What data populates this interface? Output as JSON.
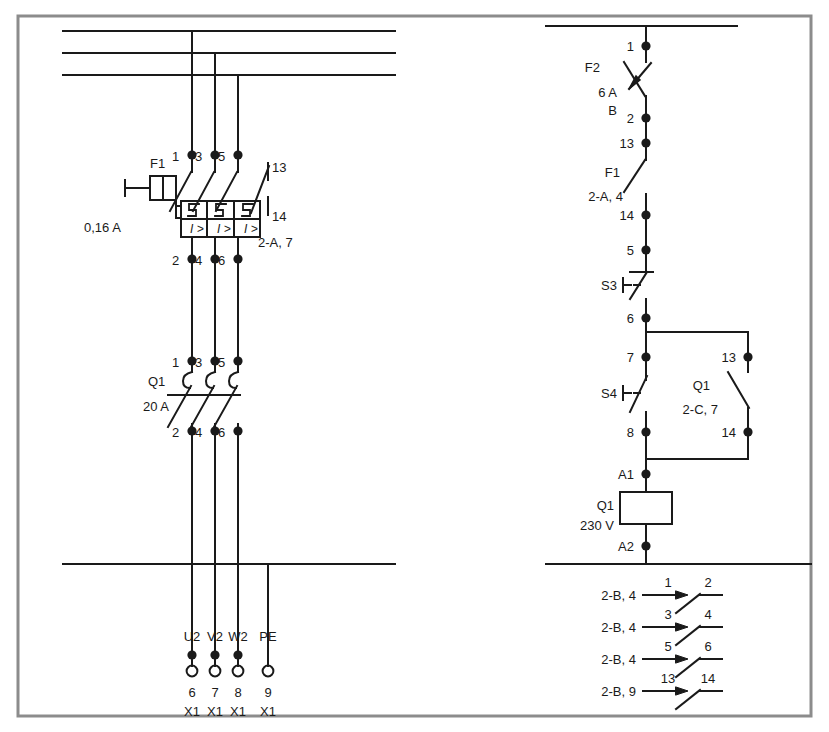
{
  "diagram": {
    "type": "electrical-schematic",
    "sheet": {
      "width": 829,
      "height": 732,
      "background": "#ffffff",
      "frame_color": "#8c8c8c",
      "line_color": "#1a1a1a"
    }
  },
  "power_circuit": {
    "name": "power-circuit-left",
    "busbars": [
      {
        "name": "L1",
        "y": 31
      },
      {
        "name": "L2",
        "y": 53
      },
      {
        "name": "L3",
        "y": 75
      }
    ],
    "phase_drops": [
      {
        "name": "L1-drop",
        "x": 192
      },
      {
        "name": "L2-drop",
        "x": 215
      },
      {
        "name": "L3-drop",
        "x": 238
      }
    ],
    "motor_protection": {
      "designation": "F1",
      "rating": "0,16 A",
      "overcurrent_symbol": "I >",
      "input_terminals": [
        "1",
        "3",
        "5"
      ],
      "output_terminals": [
        "2",
        "4",
        "6"
      ],
      "aux_contact": {
        "top": "13",
        "bottom": "14",
        "cross_reference": "2-A, 7"
      }
    },
    "contactor": {
      "designation": "Q1",
      "rating": "20 A",
      "input_terminals": [
        "1",
        "3",
        "5"
      ],
      "output_terminals": [
        "2",
        "4",
        "6"
      ]
    },
    "pe_bar": {
      "name": "PE-bar",
      "y": 564
    },
    "terminals": [
      {
        "conductor": "U2",
        "number": "6",
        "strip": "X1"
      },
      {
        "conductor": "V2",
        "number": "7",
        "strip": "X1"
      },
      {
        "conductor": "W2",
        "number": "8",
        "strip": "X1"
      },
      {
        "conductor": "PE",
        "number": "9",
        "strip": "X1"
      }
    ]
  },
  "control_circuit": {
    "name": "control-circuit-right",
    "supply_bar_y": 26,
    "neutral_bar_y": 564,
    "rail_x": 646,
    "branch_x": 748,
    "nodes": [
      {
        "label": "1",
        "y": 46
      },
      {
        "label": "2",
        "y": 118
      },
      {
        "label": "13",
        "y": 143
      },
      {
        "label": "14",
        "y": 215
      },
      {
        "label": "5",
        "y": 250
      },
      {
        "label": "6",
        "y": 318
      },
      {
        "label": "7",
        "y": 357
      },
      {
        "label": "8",
        "y": 432
      },
      {
        "label": "A1",
        "y": 474
      },
      {
        "label": "A2",
        "y": 546
      },
      {
        "label": "13",
        "y": 357
      },
      {
        "label": "14",
        "y": 432
      }
    ],
    "devices": [
      {
        "designation": "F2",
        "detail_1": "6 A",
        "detail_2": "B",
        "kind": "miniature-circuit-breaker"
      },
      {
        "designation": "F1",
        "detail_1": "2-A, 4",
        "detail_2": "",
        "kind": "overload-aux-contact"
      },
      {
        "designation": "S3",
        "detail_1": "",
        "detail_2": "",
        "kind": "nc-pushbutton"
      },
      {
        "designation": "S4",
        "detail_1": "",
        "detail_2": "",
        "kind": "no-pushbutton"
      },
      {
        "designation": "Q1",
        "detail_1": "2-C, 7",
        "detail_2": "",
        "kind": "holding-contact"
      },
      {
        "designation": "Q1",
        "detail_1": "230 V",
        "detail_2": "",
        "kind": "contactor-coil"
      }
    ],
    "contact_table": [
      {
        "cross_reference": "2-B, 4",
        "terminal_in": "1",
        "terminal_out": "2"
      },
      {
        "cross_reference": "2-B, 4",
        "terminal_in": "3",
        "terminal_out": "4"
      },
      {
        "cross_reference": "2-B, 4",
        "terminal_in": "5",
        "terminal_out": "6"
      },
      {
        "cross_reference": "2-B, 9",
        "terminal_in": "13",
        "terminal_out": "14"
      }
    ]
  }
}
